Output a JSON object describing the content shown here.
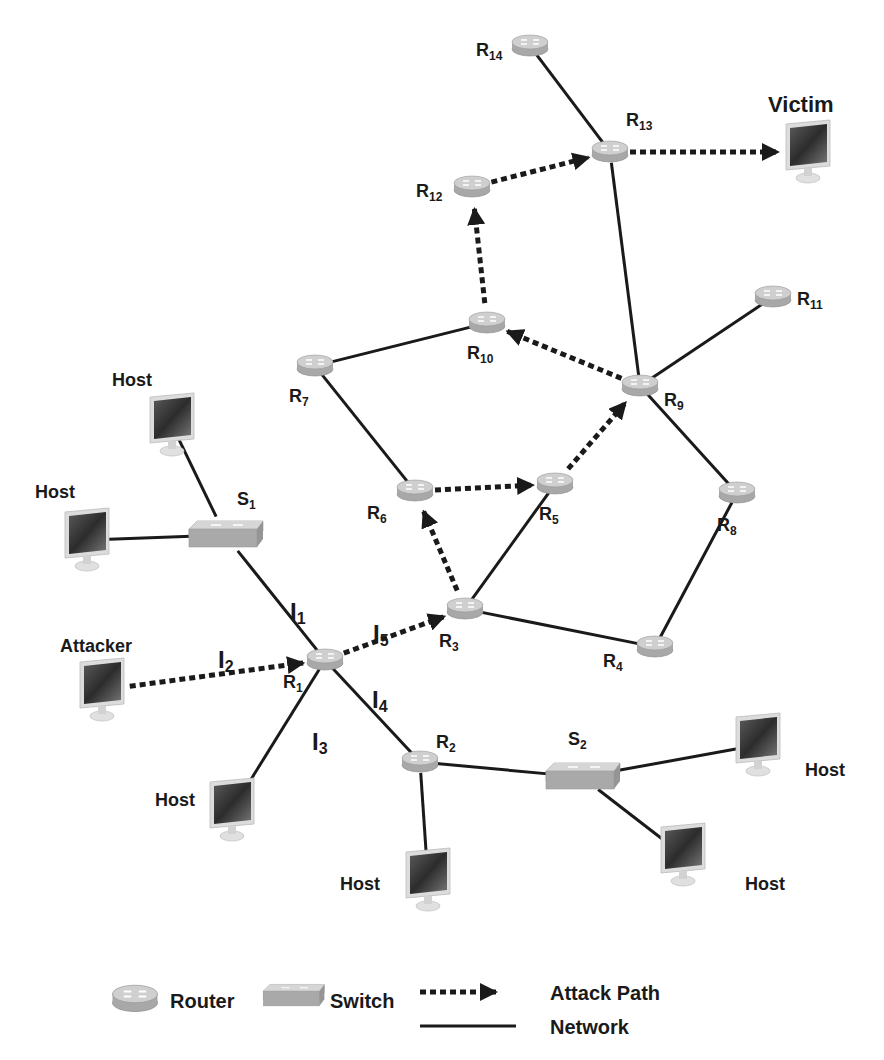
{
  "diagram": {
    "colors": {
      "line": "#1a1a1a",
      "router_top": "#cfcfcf",
      "router_side": "#a8a8a8",
      "switch_top": "#c8c8c8",
      "switch_side": "#a9a9a9",
      "screen": "#3a3a3a",
      "bezel": "#dcdcdc"
    },
    "routers": [
      {
        "id": "R1",
        "label": "R",
        "sub": "1",
        "x": 325,
        "y": 660
      },
      {
        "id": "R2",
        "label": "R",
        "sub": "2",
        "x": 420,
        "y": 762
      },
      {
        "id": "R3",
        "label": "R",
        "sub": "3",
        "x": 465,
        "y": 609
      },
      {
        "id": "R4",
        "label": "R",
        "sub": "4",
        "x": 655,
        "y": 647
      },
      {
        "id": "R5",
        "label": "R",
        "sub": "5",
        "x": 555,
        "y": 484
      },
      {
        "id": "R6",
        "label": "R",
        "sub": "6",
        "x": 415,
        "y": 491
      },
      {
        "id": "R7",
        "label": "R",
        "sub": "7",
        "x": 315,
        "y": 366
      },
      {
        "id": "R8",
        "label": "R",
        "sub": "8",
        "x": 737,
        "y": 493
      },
      {
        "id": "R9",
        "label": "R",
        "sub": "9",
        "x": 640,
        "y": 386
      },
      {
        "id": "R10",
        "label": "R",
        "sub": "10",
        "x": 487,
        "y": 323
      },
      {
        "id": "R11",
        "label": "R",
        "sub": "11",
        "x": 773,
        "y": 297
      },
      {
        "id": "R12",
        "label": "R",
        "sub": "12",
        "x": 472,
        "y": 187
      },
      {
        "id": "R13",
        "label": "R",
        "sub": "13",
        "x": 610,
        "y": 152
      },
      {
        "id": "R14",
        "label": "R",
        "sub": "14",
        "x": 530,
        "y": 46
      }
    ],
    "switches": [
      {
        "id": "S1",
        "label": "S",
        "sub": "1",
        "x": 225,
        "y": 535
      },
      {
        "id": "S2",
        "label": "S",
        "sub": "2",
        "x": 582,
        "y": 777
      }
    ],
    "hosts": [
      {
        "id": "host-top-left",
        "label": "Host",
        "x": 172,
        "y": 425,
        "label_x": 112,
        "label_y": 386
      },
      {
        "id": "host-left",
        "label": "Host",
        "x": 87,
        "y": 540,
        "label_x": 35,
        "label_y": 498
      },
      {
        "id": "attacker",
        "label": "Attacker",
        "x": 102,
        "y": 690,
        "label_x": 60,
        "label_y": 652
      },
      {
        "id": "host-bottom-left",
        "label": "Host",
        "x": 232,
        "y": 810,
        "label_x": 155,
        "label_y": 806
      },
      {
        "id": "host-bottom-mid",
        "label": "Host",
        "x": 428,
        "y": 880,
        "label_x": 340,
        "label_y": 890
      },
      {
        "id": "host-right",
        "label": "Host",
        "x": 758,
        "y": 745,
        "label_x": 805,
        "label_y": 776
      },
      {
        "id": "host-bottom-right",
        "label": "Host",
        "x": 683,
        "y": 855,
        "label_x": 745,
        "label_y": 890
      },
      {
        "id": "victim",
        "label": "Victim",
        "x": 808,
        "y": 152,
        "label_x": 768,
        "label_y": 112
      }
    ],
    "network_links": [
      [
        "R14",
        "R13"
      ],
      [
        "R13",
        "R9"
      ],
      [
        "R11",
        "R9"
      ],
      [
        "R9",
        "R8"
      ],
      [
        "R8",
        "R4"
      ],
      [
        "R4",
        "R3"
      ],
      [
        "R3",
        "R5"
      ],
      [
        "R7",
        "R10"
      ],
      [
        "R7",
        "R6"
      ],
      [
        "S1",
        "R1"
      ],
      [
        "host-top-left",
        "S1"
      ],
      [
        "host-left",
        "S1"
      ],
      [
        "R1",
        "host-bottom-left"
      ],
      [
        "R1",
        "R2"
      ],
      [
        "R2",
        "S2"
      ],
      [
        "R2",
        "host-bottom-mid"
      ],
      [
        "S2",
        "host-right"
      ],
      [
        "S2",
        "host-bottom-right"
      ]
    ],
    "attack_path": [
      [
        "attacker",
        "R1"
      ],
      [
        "R1",
        "R3"
      ],
      [
        "R3",
        "R6"
      ],
      [
        "R6",
        "R5"
      ],
      [
        "R5",
        "R9"
      ],
      [
        "R9",
        "R10"
      ],
      [
        "R10",
        "R12"
      ],
      [
        "R12",
        "R13"
      ],
      [
        "R13",
        "victim"
      ]
    ],
    "interface_labels": [
      {
        "id": "l1",
        "text": "I",
        "sub": "1",
        "x": 290,
        "y": 620
      },
      {
        "id": "l2",
        "text": "I",
        "sub": "2",
        "x": 218,
        "y": 668
      },
      {
        "id": "l3",
        "text": "I",
        "sub": "3",
        "x": 312,
        "y": 750
      },
      {
        "id": "l4",
        "text": "I",
        "sub": "4",
        "x": 372,
        "y": 708
      },
      {
        "id": "l5",
        "text": "I",
        "sub": "5",
        "x": 373,
        "y": 642
      }
    ]
  },
  "legend": {
    "router_label": "Router",
    "switch_label": "Switch",
    "attack_path_label": "Attack Path",
    "network_label": "Network"
  }
}
